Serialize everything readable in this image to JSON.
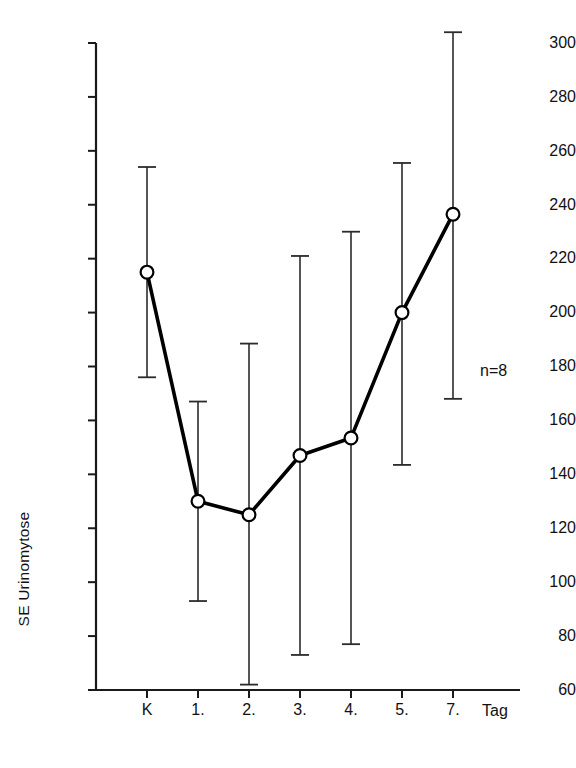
{
  "figure": {
    "annotation": "n=8",
    "colors": {
      "axis": "#1a1a1a",
      "line": "#000000",
      "errorbar": "#2b2b2b",
      "marker_fill": "#ffffff",
      "marker_stroke": "#000000",
      "background": "#ffffff"
    }
  },
  "chart_data": {
    "type": "line",
    "title": "",
    "subtitle": "",
    "xlabel": "Tag",
    "ylabel": "SE Urinomytose",
    "categories": [
      "K",
      "1.",
      "2.",
      "3.",
      "4.",
      "5.",
      "7."
    ],
    "values": [
      215,
      130,
      125,
      147,
      153.5,
      200,
      236.5
    ],
    "error_upper": [
      254,
      167,
      188.5,
      221,
      230,
      255.5,
      304
    ],
    "error_lower": [
      176,
      93,
      62,
      73,
      77,
      143.5,
      168
    ],
    "series": [
      {
        "name": "SE Urinomytose",
        "values": [
          215,
          130,
          125,
          147,
          153.5,
          200,
          236.5
        ]
      }
    ],
    "ylim": [
      60,
      300
    ],
    "ytick_step": 20,
    "yticks": [
      60,
      80,
      100,
      120,
      140,
      160,
      180,
      200,
      220,
      240,
      260,
      280,
      300
    ],
    "ytick_labels": [
      "60",
      "80",
      "100",
      "120",
      "140",
      "160",
      "180",
      "200",
      "220",
      "240",
      "260",
      "280",
      "300"
    ],
    "xtick_labels": [
      "K",
      "1.",
      "2.",
      "3.",
      "4.",
      "5.",
      "7."
    ],
    "grid": false,
    "legend": null,
    "annotations": [
      {
        "text": "n=8",
        "x": "7.",
        "y": 180
      }
    ],
    "marker": "open-circle",
    "errorbar_style": "capped-vertical"
  }
}
